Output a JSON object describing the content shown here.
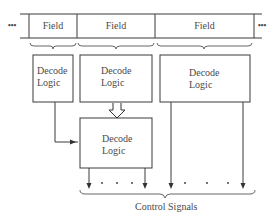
{
  "instruction_word": {
    "ellipsis_left": "•••",
    "ellipsis_right": "•••",
    "fields": [
      {
        "label": "Field"
      },
      {
        "label": "Field"
      },
      {
        "label": "Field"
      }
    ]
  },
  "decoders": [
    {
      "line1": "Decode",
      "line2": "Logic"
    },
    {
      "line1": "Decode",
      "line2": "Logic"
    },
    {
      "line1": "Decode",
      "line2": "Logic"
    },
    {
      "line1": "Decode",
      "line2": "Logic"
    }
  ],
  "output_dots": ". . .",
  "output_label": "Control Signals",
  "colors": {
    "stroke": "#3a3a3a",
    "text": "#4a4a4a",
    "background": "#ffffff"
  }
}
